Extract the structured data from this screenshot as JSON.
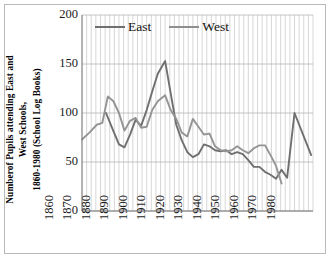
{
  "chart_data": {
    "type": "line",
    "title": "",
    "xlabel": "",
    "ylabel": "Numberof Pupils attending East and West Schools, 1860-1980 (School Log Books)",
    "ylabel_lines": [
      "Numberof Pupils attending East and",
      "West Schools,",
      "1860-1980 (School Log Books)"
    ],
    "ylim": [
      0,
      200
    ],
    "y_ticks": [
      0,
      50,
      100,
      150,
      200
    ],
    "y_tick_labels": [
      "0",
      "50",
      "100",
      "150",
      "200"
    ],
    "xlim": [
      1860,
      1985
    ],
    "x_ticks": [
      1860,
      1870,
      1880,
      1890,
      1900,
      1910,
      1920,
      1930,
      1940,
      1950,
      1960,
      1970,
      1980
    ],
    "x_tick_labels": [
      "1860",
      "1870",
      "1880",
      "1890",
      "1900",
      "1910",
      "1920",
      "1930",
      "1940",
      "1950",
      "1960",
      "1970",
      "1980"
    ],
    "grid": "vertical-and-horizontal",
    "legend_position": "top-center-inside",
    "series": [
      {
        "name": "East",
        "color": "#6f6f6f",
        "x": [
          1873,
          1876,
          1880,
          1883,
          1886,
          1889,
          1892,
          1895,
          1898,
          1901,
          1905,
          1908,
          1911,
          1914,
          1917,
          1920,
          1923,
          1926,
          1929,
          1932,
          1935,
          1938,
          1941,
          1944,
          1947,
          1950,
          1953,
          1956,
          1959,
          1962,
          1965,
          1968,
          1971,
          1975,
          1984
        ],
        "values": [
          100,
          86,
          68,
          65,
          78,
          93,
          87,
          103,
          122,
          140,
          153,
          120,
          88,
          72,
          60,
          55,
          58,
          68,
          66,
          62,
          61,
          62,
          58,
          60,
          58,
          52,
          45,
          45,
          40,
          37,
          33,
          42,
          34,
          100,
          57
        ]
      },
      {
        "name": "West",
        "color": "#949494",
        "x": [
          1860,
          1864,
          1868,
          1871,
          1874,
          1877,
          1880,
          1883,
          1886,
          1889,
          1892,
          1895,
          1898,
          1901,
          1905,
          1908,
          1911,
          1914,
          1917,
          1920,
          1923,
          1926,
          1929,
          1932,
          1935,
          1938,
          1941,
          1944,
          1947,
          1950,
          1953,
          1956,
          1959,
          1962,
          1965,
          1968
        ],
        "values": [
          73,
          80,
          88,
          90,
          117,
          112,
          100,
          82,
          92,
          95,
          85,
          86,
          103,
          112,
          118,
          103,
          94,
          80,
          76,
          94,
          86,
          78,
          79,
          66,
          62,
          61,
          62,
          66,
          62,
          59,
          64,
          67,
          67,
          57,
          46,
          28
        ]
      }
    ]
  },
  "legend": {
    "items": [
      {
        "label": "East",
        "color": "#6f6f6f"
      },
      {
        "label": "West",
        "color": "#8e8e8e"
      }
    ]
  }
}
